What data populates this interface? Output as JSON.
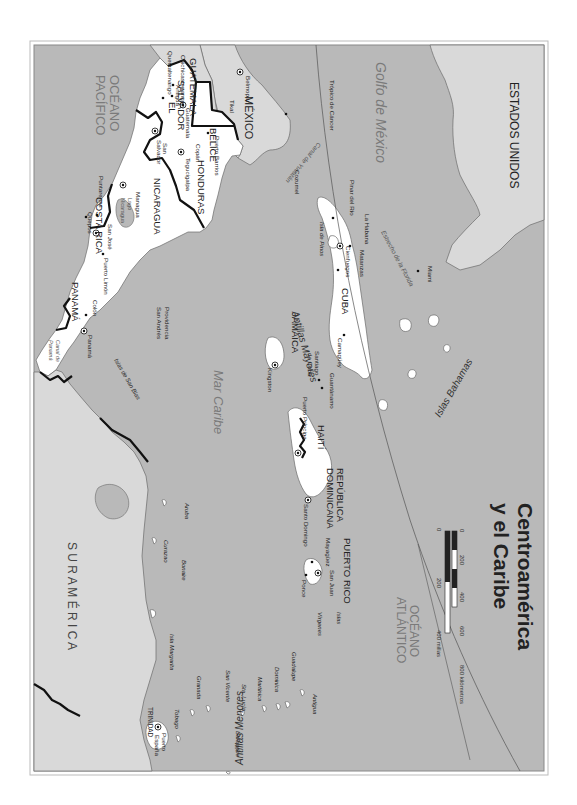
{
  "map": {
    "title_line1": "Centroamérica",
    "title_line2": "y el Caribe",
    "orientation": "rotated 90° clockwise (north points right)",
    "colors": {
      "sea": "#b9b9b9",
      "featured_land": "#ffffff",
      "other_land": "#d9d9d9",
      "border": "#111111",
      "paper": "#ffffff"
    },
    "scale": {
      "km_label_0": "0",
      "km_label_200": "200",
      "km_label_400": "400",
      "km_label_600": "600",
      "km_label_800": "800 kilómetros",
      "mi_label_0": "0",
      "mi_label_200": "200",
      "mi_label_400": "400 millas"
    },
    "regions": {
      "estados_unidos": "ESTADOS UNIDOS",
      "mexico": "MÉXICO",
      "suramerica": "S U R A M É R I C A"
    },
    "countries": {
      "guatemala": "GUATEMALA",
      "belice": "BELICE",
      "el_salvador_1": "EL",
      "el_salvador_2": "SALVADOR",
      "honduras": "HONDURAS",
      "nicaragua": "NICARAGUA",
      "costa_rica": "COSTA RICA",
      "panama": "PANAMÁ",
      "cuba": "CUBA",
      "jamaica": "JAMAICA",
      "haiti": "HAITÍ",
      "rep_dom_1": "REPÚBLICA",
      "rep_dom_2": "DOMINICANA",
      "puerto_rico": "PUERTO RICO",
      "trinidad": "TRINIDAD"
    },
    "water": {
      "golfo_1": "Golfo de México",
      "oceano_pacifico_1": "OCÉANO",
      "oceano_pacifico_2": "PACÍFICO",
      "oceano_atlantico_1": "OCÉANO",
      "oceano_atlantico_2": "ATLÁNTICO",
      "mar_caribe": "Mar Caribe",
      "canal_yucatan": "Canal de Yucatán",
      "estrecho_florida": "Estrecho de la Florida",
      "canal_panama_1": "Canal de",
      "canal_panama_2": "Panamá",
      "lago_nicaragua_1": "Lago",
      "lago_nicaragua_2": "Nicaragua",
      "tropico": "Trópico de Cáncer"
    },
    "groups": {
      "antillas_mayores": "Antillas Mayores",
      "antillas_menores": "Antillas Menores",
      "islas_bahamas": "Islas Bahamas",
      "islas_virgenes_1": "Islas",
      "islas_virgenes_2": "Vírgenes",
      "islas_san_blas": "Islas de San Blas"
    },
    "cities": {
      "chichicastenango": "Chichicastenango",
      "quetzaltenango": "Quetzaltenango",
      "antigua_gt": "Antigua",
      "guatemala": "Guatemala",
      "tikal": "Tikal",
      "belmopan": "Belmopán",
      "copan": "Copán",
      "tegucigalpa": "Tegucigalpa",
      "puerto_barrios": "Puerto Barrios",
      "san_salvador_1": "San",
      "san_salvador_2": "Salvador",
      "managua": "Managua",
      "puntarenas": "Puntarenas",
      "quepos": "Quepos",
      "san_jose": "San José",
      "puerto_limon": "Puerto Limón",
      "colon": "Colón",
      "panama": "Panamá",
      "cozumel": "Cozumel",
      "pinar_del_rio": "Pinar del Río",
      "la_habana": "La Habana",
      "matanzas": "Matanzas",
      "cienfuegos": "Cienfuegos",
      "camaguey": "Camagüey",
      "santiago_1": "Santiago",
      "santiago_2": "de Cuba",
      "guantanamo": "Guantánamo",
      "kingston": "Kingston",
      "puerto_principe": "Puerto Príncipe",
      "santo_domingo": "Santo Domingo",
      "mayaguez": "Mayagüez",
      "san_juan": "San Juan",
      "ponce": "Ponce",
      "miami": "Miami",
      "puerto_espana_1": "Puerto",
      "puerto_espana_2": "España"
    },
    "islands": {
      "isla_de_pinos": "Isla de Pinos",
      "providencia": "Providencia",
      "san_andres": "San Andrés",
      "aruba": "Aruba",
      "curazao": "Curazao",
      "bonaire": "Bonaire",
      "isla_margarita": "Isla Margarita",
      "granada": "Granada",
      "tobago": "Tobago",
      "san_vicente": "San Vicente",
      "sta_lucia": "Sta. Lucía",
      "barbados": "Barbados",
      "martinica": "Martinica",
      "dominica": "Dominica",
      "guadalupe": "Guadalupe",
      "antigua": "Antigua"
    }
  }
}
